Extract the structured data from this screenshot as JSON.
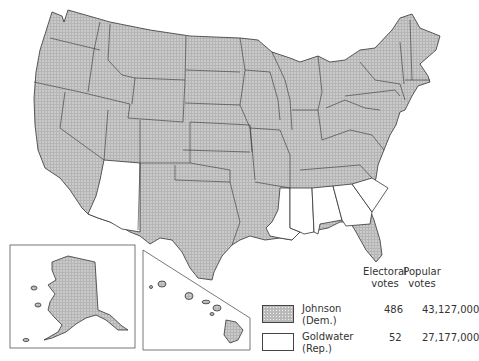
{
  "map": {
    "subject": "1964 U.S. presidential election results by state",
    "colors": {
      "johnson_fill": "#b9b9b9",
      "goldwater_fill": "#ffffff",
      "border": "#333333"
    },
    "goldwater_states": [
      "Arizona",
      "Louisiana",
      "Mississippi",
      "Alabama",
      "Georgia",
      "South Carolina"
    ],
    "insets": [
      "Alaska",
      "Hawaii"
    ]
  },
  "legend": {
    "col_electoral": "Electoral votes",
    "col_electoral_l1": "Electoral",
    "col_electoral_l2": "votes",
    "col_popular_l1": "Popular",
    "col_popular_l2": "votes",
    "rows": [
      {
        "swatch": "stippled",
        "name_l1": "Johnson",
        "name_l2": "(Dem.)",
        "electoral": "486",
        "popular": "43,127,000"
      },
      {
        "swatch": "white",
        "name_l1": "Goldwater",
        "name_l2": "(Rep.)",
        "electoral": "52",
        "popular": "27,177,000"
      }
    ]
  }
}
